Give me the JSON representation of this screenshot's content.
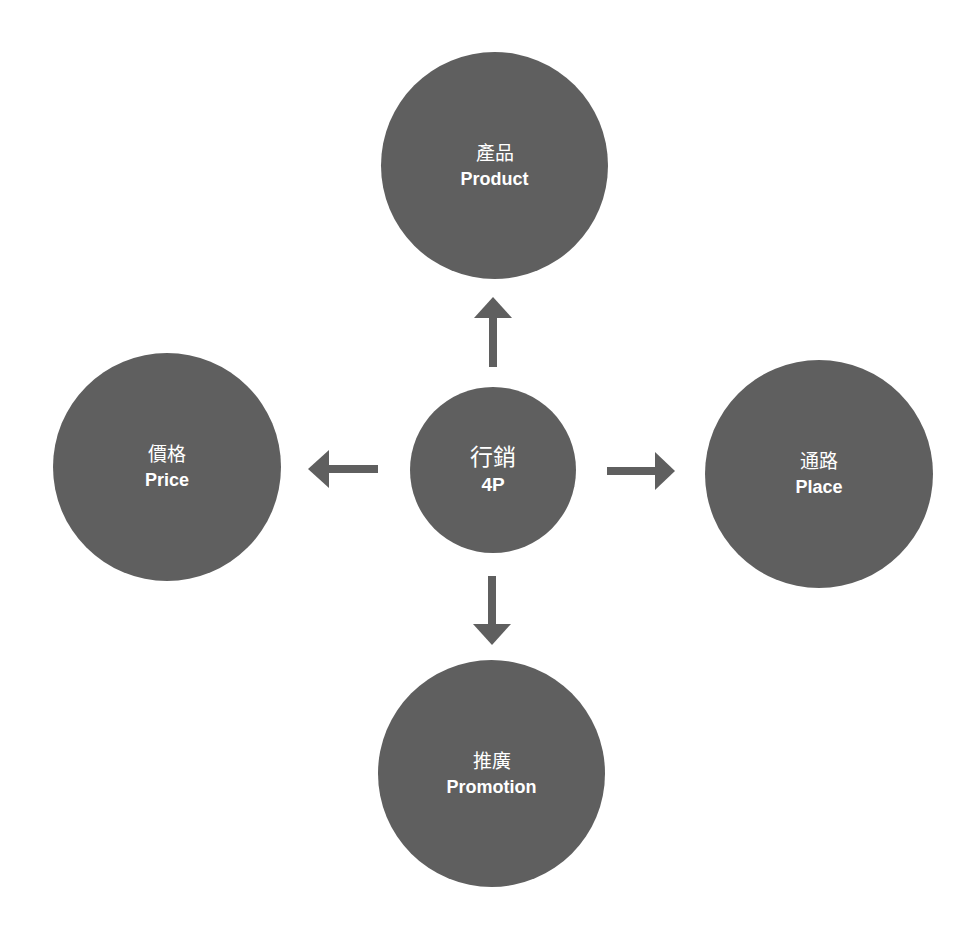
{
  "diagram": {
    "title": "行銷 4P",
    "colors": {
      "node_fill": "#5f5f5f",
      "arrow": "#5f5f5f",
      "text": "#ffffff",
      "background": "#ffffff"
    },
    "center": {
      "zh": "行銷",
      "en": "4P"
    },
    "nodes": [
      {
        "id": "product",
        "zh": "產品",
        "en": "Product",
        "position": "top"
      },
      {
        "id": "price",
        "zh": "價格",
        "en": "Price",
        "position": "left"
      },
      {
        "id": "place",
        "zh": "通路",
        "en": "Place",
        "position": "right"
      },
      {
        "id": "promotion",
        "zh": "推廣",
        "en": "Promotion",
        "position": "bottom"
      }
    ],
    "edges": [
      {
        "from": "center",
        "to": "product",
        "direction": "up"
      },
      {
        "from": "center",
        "to": "price",
        "direction": "left"
      },
      {
        "from": "center",
        "to": "place",
        "direction": "right"
      },
      {
        "from": "center",
        "to": "promotion",
        "direction": "down"
      }
    ]
  }
}
